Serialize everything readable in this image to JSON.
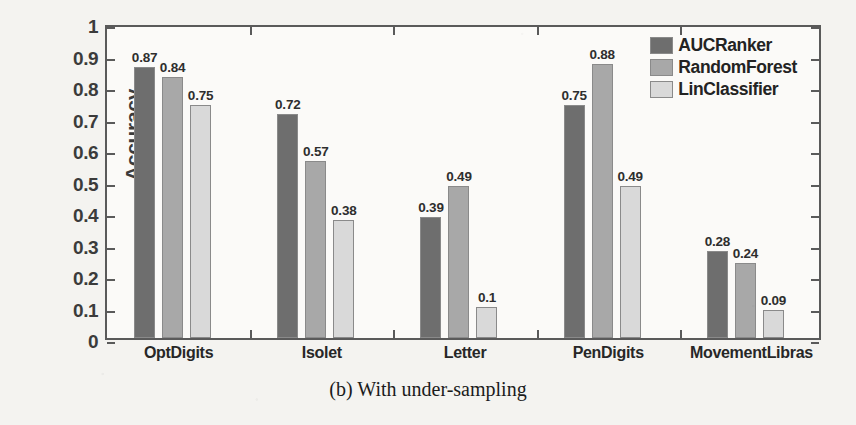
{
  "caption": "(b) With under-sampling",
  "chart_data": {
    "type": "bar",
    "title": "",
    "xlabel": "",
    "ylabel": "Accuracy",
    "ylim": [
      0,
      1
    ],
    "ytick_labels": [
      "0",
      "0.1",
      "0.2",
      "0.3",
      "0.4",
      "0.5",
      "0.6",
      "0.7",
      "0.8",
      "0.9",
      "1"
    ],
    "ytick_values": [
      0,
      0.1,
      0.2,
      0.3,
      0.4,
      0.5,
      0.6,
      0.7,
      0.8,
      0.9,
      1
    ],
    "grid": false,
    "legend_position": "top-right-inside",
    "categories": [
      "OptDigits",
      "Isolet",
      "Letter",
      "PenDigits",
      "MovementLibras"
    ],
    "series": [
      {
        "name": "AUCRanker",
        "color": "#6e6e6e",
        "values": [
          0.87,
          0.72,
          0.39,
          0.75,
          0.28
        ],
        "labels": [
          "0.87",
          "0.72",
          "0.39",
          "0.75",
          "0.28"
        ]
      },
      {
        "name": "RandomForest",
        "color": "#a8a8a8",
        "values": [
          0.84,
          0.57,
          0.49,
          0.88,
          0.24
        ],
        "labels": [
          "0.84",
          "0.57",
          "0.49",
          "0.88",
          "0.24"
        ]
      },
      {
        "name": "LinClassifier",
        "color": "#d9d9d9",
        "values": [
          0.75,
          0.38,
          0.1,
          0.49,
          0.09
        ],
        "labels": [
          "0.75",
          "0.38",
          "0.1",
          "0.49",
          "0.09"
        ]
      }
    ]
  }
}
